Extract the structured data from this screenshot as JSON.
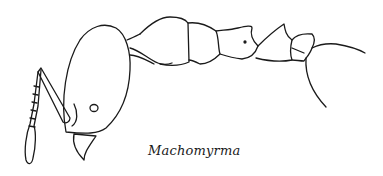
{
  "figure": {
    "caption": "Machomyrma"
  }
}
